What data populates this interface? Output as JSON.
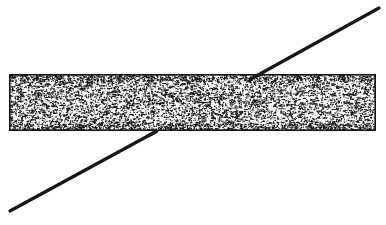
{
  "figure": {
    "title": "Stippled horizontal bar crossed by a diagonal line",
    "kind": "technical-line-art",
    "caption": "",
    "background_color": "#ffffff",
    "ink_color": "#1a1a1a",
    "canvas": {
      "width": 386,
      "height": 225
    }
  },
  "bar": {
    "name": "stippled-bar",
    "label": "",
    "x": 9,
    "y": 74,
    "width": 367,
    "height": 57,
    "border_color": "#151515",
    "border_width": 1.6,
    "fill_color": "#ffffff",
    "fill_style": "stipple",
    "stipple": {
      "dot_count": 9000,
      "dot_color": "#141414",
      "dot_min_size": 0.45,
      "dot_max_size": 1.55,
      "density_note": "dense random speckle, slightly denser near left and lower-right",
      "seed": 20240617
    }
  },
  "diagonal_line": {
    "name": "diagonal-line",
    "label": "",
    "color": "#161616",
    "width": 3.2,
    "linecap": "round",
    "start": {
      "x": 10,
      "y": 211
    },
    "end": {
      "x": 379,
      "y": 8
    },
    "exit_bottom": {
      "x": 157,
      "y": 131
    },
    "exit_top": {
      "x": 249,
      "y": 80
    },
    "hidden_inside_bar": true
  },
  "annotations": [],
  "legend": {
    "visible": false,
    "entries": []
  }
}
